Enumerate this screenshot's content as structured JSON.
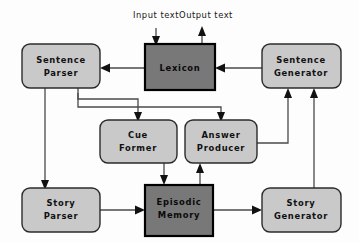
{
  "diagram": {
    "io_labels": {
      "input": "Input  text",
      "output": "Output  text"
    },
    "colors": {
      "light_box_fill": "#c9c9c9",
      "dark_box_fill": "#787878",
      "box_stroke": "#2b2b2b",
      "dark_box_stroke": "#000000",
      "edge_stroke": "#4a4a4a",
      "text": "#111111",
      "background": "#fdfdfd"
    },
    "nodes": [
      {
        "id": "sentence-parser",
        "line1": "Sentence",
        "line2": "Parser",
        "style": "light",
        "shape": "rounded"
      },
      {
        "id": "lexicon",
        "line1": "Lexicon",
        "line2": "",
        "style": "dark",
        "shape": "square"
      },
      {
        "id": "sentence-generator",
        "line1": "Sentence",
        "line2": "Generator",
        "style": "light",
        "shape": "rounded"
      },
      {
        "id": "cue-former",
        "line1": "Cue",
        "line2": "Former",
        "style": "light",
        "shape": "rounded"
      },
      {
        "id": "answer-producer",
        "line1": "Answer",
        "line2": "Producer",
        "style": "light",
        "shape": "rounded"
      },
      {
        "id": "story-parser",
        "line1": "Story",
        "line2": "Parser",
        "style": "light",
        "shape": "rounded"
      },
      {
        "id": "episodic-memory",
        "line1": "Episodic",
        "line2": "Memory",
        "style": "dark",
        "shape": "square"
      },
      {
        "id": "story-generator",
        "line1": "Story",
        "line2": "Generator",
        "style": "light",
        "shape": "rounded"
      }
    ],
    "edges": [
      {
        "id": "input-to-lexicon",
        "from": "Input text",
        "to": "Lexicon"
      },
      {
        "id": "lexicon-to-output",
        "from": "Lexicon",
        "to": "Output text"
      },
      {
        "id": "lexicon-to-sentence-parser",
        "from": "Lexicon",
        "to": "Sentence Parser"
      },
      {
        "id": "sentence-generator-to-lexicon",
        "from": "Sentence Generator",
        "to": "Lexicon"
      },
      {
        "id": "sentence-parser-to-story-parser",
        "from": "Sentence Parser",
        "to": "Story Parser"
      },
      {
        "id": "sentence-parser-to-cue-former",
        "from": "Sentence Parser",
        "to": "Cue Former"
      },
      {
        "id": "sentence-parser-to-answer-producer",
        "from": "Sentence Parser",
        "to": "Answer Producer"
      },
      {
        "id": "cue-former-to-episodic-memory",
        "from": "Cue Former",
        "to": "Episodic Memory"
      },
      {
        "id": "episodic-memory-to-answer-producer",
        "from": "Episodic Memory",
        "to": "Answer Producer"
      },
      {
        "id": "answer-producer-to-sentence-generator",
        "from": "Answer Producer",
        "to": "Sentence Generator"
      },
      {
        "id": "story-parser-to-episodic-memory",
        "from": "Story Parser",
        "to": "Episodic Memory"
      },
      {
        "id": "episodic-memory-to-story-generator",
        "from": "Episodic Memory",
        "to": "Story Generator"
      },
      {
        "id": "story-generator-to-sentence-generator",
        "from": "Story Generator",
        "to": "Sentence Generator"
      }
    ]
  }
}
